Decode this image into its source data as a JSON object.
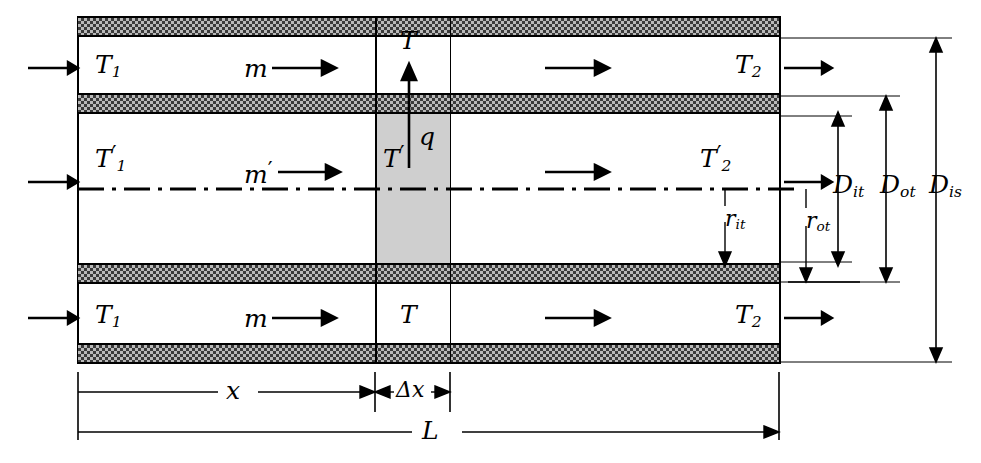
{
  "figure": {
    "kind": "heat-exchanger-schematic"
  },
  "colors": {
    "line": "#000000",
    "wall_fill": "#b9b9b9",
    "wall_hatch": "#3a3a3a",
    "control_volume_fill": "#cfcfcf",
    "background": "#ffffff"
  },
  "channels": {
    "top": {
      "inlet_temp": "T",
      "inlet_temp_sub": "1",
      "mass_flow": "m",
      "cv_temp": "T",
      "outlet_temp": "T",
      "outlet_temp_sub": "2"
    },
    "middle": {
      "inlet_temp": "T",
      "inlet_temp_sub": "1",
      "inlet_temp_prime": true,
      "mass_flow": "m",
      "mass_flow_prime": true,
      "cv_temp": "T",
      "cv_temp_prime": true,
      "outlet_temp": "T",
      "outlet_temp_sub": "2",
      "outlet_temp_prime": true
    },
    "bottom": {
      "inlet_temp": "T",
      "inlet_temp_sub": "1",
      "mass_flow": "m",
      "cv_temp": "T",
      "outlet_temp": "T",
      "outlet_temp_sub": "2"
    }
  },
  "heat_flux": {
    "label": "q",
    "direction": "up",
    "tip_label": "T"
  },
  "radial_dimensions": [
    {
      "name": "r_it",
      "symbol": "r",
      "sub": "it"
    },
    {
      "name": "r_ot",
      "symbol": "r",
      "sub": "ot"
    },
    {
      "name": "D_it",
      "symbol": "D",
      "sub": "it"
    },
    {
      "name": "D_ot",
      "symbol": "D",
      "sub": "ot"
    },
    {
      "name": "D_is",
      "symbol": "D",
      "sub": "is"
    }
  ],
  "axial_dimensions": [
    {
      "name": "x",
      "symbol": "x",
      "sub": ""
    },
    {
      "name": "delta_x",
      "symbol": "Δx",
      "sub": ""
    },
    {
      "name": "L",
      "symbol": "L",
      "sub": ""
    }
  ],
  "centerline": {
    "style": "dash-dot"
  }
}
